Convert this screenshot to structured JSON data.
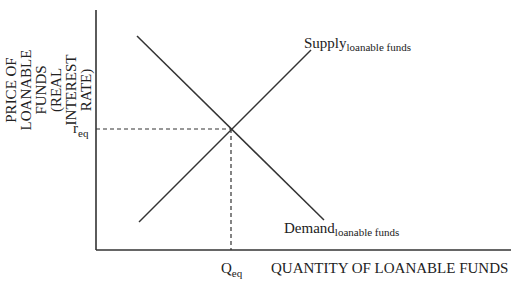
{
  "diagram": {
    "y_axis_label_lines": [
      "PRICE OF",
      "LOANABLE",
      "FUNDS",
      "(REAL",
      "INTEREST",
      "RATE)"
    ],
    "x_axis_label": "QUANTITY OF LOANABLE FUNDS",
    "supply_label": {
      "main": "Supply",
      "sub": "loanable funds"
    },
    "demand_label": {
      "main": "Demand",
      "sub": "loanable funds"
    },
    "r_label": {
      "main": "r",
      "sub": "eq"
    },
    "q_label": {
      "main": "Q",
      "sub": "eq"
    },
    "colors": {
      "line": "#333333",
      "text": "#222222"
    }
  }
}
